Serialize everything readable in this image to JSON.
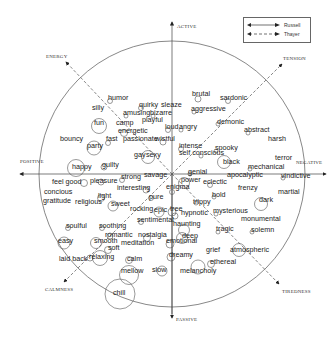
{
  "legend": {
    "items": [
      {
        "label": "Russell",
        "style": "solid"
      },
      {
        "label": "Thayer",
        "style": "dashed"
      }
    ]
  },
  "axes": {
    "active": "ACTIVE",
    "passive": "PASSIVE",
    "positive": "POSITIVE",
    "negative": "NEGATIVE",
    "energy": "ENERGY",
    "tension": "TENSION",
    "calmness": "CALMNESS",
    "tiredness": "TIREDNESS"
  },
  "words": [
    {
      "t": "brutal",
      "x": 194,
      "y": 94
    },
    {
      "t": "sardonic",
      "x": 222,
      "y": 98
    },
    {
      "t": "humor",
      "x": 110,
      "y": 98
    },
    {
      "t": "quirky",
      "x": 141,
      "y": 105
    },
    {
      "t": "sleaze",
      "x": 163,
      "y": 105
    },
    {
      "t": "silly",
      "x": 94,
      "y": 108
    },
    {
      "t": "aggressive",
      "x": 193,
      "y": 109
    },
    {
      "t": "amusing",
      "x": 125,
      "y": 113
    },
    {
      "t": "bizarre",
      "x": 152,
      "y": 113
    },
    {
      "t": "playful",
      "x": 144,
      "y": 120
    },
    {
      "t": "fun",
      "x": 96,
      "y": 123
    },
    {
      "t": "camp",
      "x": 118,
      "y": 123
    },
    {
      "t": "demonic",
      "x": 219,
      "y": 122
    },
    {
      "t": "loud",
      "x": 167,
      "y": 127
    },
    {
      "t": "angry",
      "x": 181,
      "y": 127
    },
    {
      "t": "energetic",
      "x": 120,
      "y": 131
    },
    {
      "t": "abstract",
      "x": 246,
      "y": 130
    },
    {
      "t": "bouncy",
      "x": 62,
      "y": 139
    },
    {
      "t": "fast",
      "x": 108,
      "y": 139
    },
    {
      "t": "passionate",
      "x": 125,
      "y": 139
    },
    {
      "t": "wistful",
      "x": 157,
      "y": 139
    },
    {
      "t": "harsh",
      "x": 270,
      "y": 139
    },
    {
      "t": "party",
      "x": 89,
      "y": 146
    },
    {
      "t": "intense",
      "x": 181,
      "y": 146
    },
    {
      "t": "spooky",
      "x": 217,
      "y": 148
    },
    {
      "t": "self conscious",
      "x": 181,
      "y": 153
    },
    {
      "t": "gay",
      "x": 136,
      "y": 155
    },
    {
      "t": "sexy",
      "x": 148,
      "y": 155
    },
    {
      "t": "terror",
      "x": 277,
      "y": 158
    },
    {
      "t": "black",
      "x": 225,
      "y": 162
    },
    {
      "t": "mechanical",
      "x": 250,
      "y": 167
    },
    {
      "t": "happy",
      "x": 74,
      "y": 167
    },
    {
      "t": "guilty",
      "x": 104,
      "y": 165
    },
    {
      "t": "strong",
      "x": 123,
      "y": 177
    },
    {
      "t": "savage",
      "x": 146,
      "y": 175
    },
    {
      "t": "genial",
      "x": 190,
      "y": 172
    },
    {
      "t": "apocalyptic",
      "x": 229,
      "y": 175
    },
    {
      "t": "vindictive",
      "x": 283,
      "y": 176
    },
    {
      "t": "feel good",
      "x": 54,
      "y": 182
    },
    {
      "t": "pleasure",
      "x": 92,
      "y": 181
    },
    {
      "t": "power",
      "x": 183,
      "y": 180
    },
    {
      "t": "eclectic",
      "x": 205,
      "y": 182
    },
    {
      "t": "interesting",
      "x": 119,
      "y": 188
    },
    {
      "t": "enigma",
      "x": 168,
      "y": 187
    },
    {
      "t": "frenzy",
      "x": 240,
      "y": 188
    },
    {
      "t": "concious",
      "x": 46,
      "y": 192
    },
    {
      "t": "martial",
      "x": 280,
      "y": 192
    },
    {
      "t": "light",
      "x": 100,
      "y": 196
    },
    {
      "t": "pure",
      "x": 151,
      "y": 197
    },
    {
      "t": "bold",
      "x": 214,
      "y": 195
    },
    {
      "t": "trippy",
      "x": 195,
      "y": 202
    },
    {
      "t": "dark",
      "x": 261,
      "y": 200
    },
    {
      "t": "gratitude",
      "x": 45,
      "y": 201
    },
    {
      "t": "religious",
      "x": 77,
      "y": 202
    },
    {
      "t": "sweet",
      "x": 113,
      "y": 204
    },
    {
      "t": "rocking",
      "x": 132,
      "y": 209
    },
    {
      "t": "epic",
      "x": 156,
      "y": 210
    },
    {
      "t": "tree",
      "x": 172,
      "y": 209
    },
    {
      "t": "hypnotic",
      "x": 183,
      "y": 213
    },
    {
      "t": "mysterious",
      "x": 215,
      "y": 211
    },
    {
      "t": "monumental",
      "x": 243,
      "y": 219
    },
    {
      "t": "sentimental",
      "x": 139,
      "y": 220
    },
    {
      "t": "haunting",
      "x": 175,
      "y": 224
    },
    {
      "t": "soulful",
      "x": 68,
      "y": 226
    },
    {
      "t": "soothing",
      "x": 101,
      "y": 226
    },
    {
      "t": "tragic",
      "x": 218,
      "y": 229
    },
    {
      "t": "solemn",
      "x": 253,
      "y": 230
    },
    {
      "t": "romantic",
      "x": 107,
      "y": 235
    },
    {
      "t": "nostalgia",
      "x": 140,
      "y": 235
    },
    {
      "t": "deep",
      "x": 184,
      "y": 236
    },
    {
      "t": "easy",
      "x": 60,
      "y": 241
    },
    {
      "t": "smooth",
      "x": 96,
      "y": 241
    },
    {
      "t": "meditation",
      "x": 123,
      "y": 243
    },
    {
      "t": "emotional",
      "x": 168,
      "y": 241
    },
    {
      "t": "soft",
      "x": 110,
      "y": 248
    },
    {
      "t": "grief",
      "x": 208,
      "y": 250
    },
    {
      "t": "atmospheric",
      "x": 232,
      "y": 250
    },
    {
      "t": "dreamy",
      "x": 171,
      "y": 255
    },
    {
      "t": "laid back",
      "x": 61,
      "y": 259
    },
    {
      "t": "relaxing",
      "x": 91,
      "y": 257
    },
    {
      "t": "calm",
      "x": 129,
      "y": 259
    },
    {
      "t": "ethereal",
      "x": 212,
      "y": 262
    },
    {
      "t": "mellow",
      "x": 123,
      "y": 271
    },
    {
      "t": "slow",
      "x": 154,
      "y": 270
    },
    {
      "t": "melancholy",
      "x": 182,
      "y": 271
    },
    {
      "t": "chill",
      "x": 115,
      "y": 293
    }
  ],
  "circles": [
    {
      "cx": 198,
      "cy": 99,
      "r": 3
    },
    {
      "cx": 228,
      "cy": 101,
      "r": 2.5
    },
    {
      "cx": 110,
      "cy": 101,
      "r": 2.5
    },
    {
      "cx": 141,
      "cy": 108,
      "r": 2.5
    },
    {
      "cx": 194,
      "cy": 112,
      "r": 2
    },
    {
      "cx": 126,
      "cy": 116,
      "r": 2
    },
    {
      "cx": 153,
      "cy": 116,
      "r": 2
    },
    {
      "cx": 99,
      "cy": 126,
      "r": 7.5
    },
    {
      "cx": 168,
      "cy": 130,
      "r": 2.5
    },
    {
      "cx": 181,
      "cy": 130,
      "r": 2
    },
    {
      "cx": 124,
      "cy": 133,
      "r": 3.5
    },
    {
      "cx": 218,
      "cy": 124,
      "r": 2
    },
    {
      "cx": 248,
      "cy": 133,
      "r": 2
    },
    {
      "cx": 108,
      "cy": 143,
      "r": 2.5
    },
    {
      "cx": 163,
      "cy": 142,
      "r": 3
    },
    {
      "cx": 94,
      "cy": 148,
      "r": 7
    },
    {
      "cx": 181,
      "cy": 149,
      "r": 2.5
    },
    {
      "cx": 216,
      "cy": 151,
      "r": 2
    },
    {
      "cx": 201,
      "cy": 156,
      "r": 2
    },
    {
      "cx": 148,
      "cy": 157,
      "r": 6.5
    },
    {
      "cx": 224,
      "cy": 162,
      "r": 6.5
    },
    {
      "cx": 250,
      "cy": 169,
      "r": 2
    },
    {
      "cx": 76,
      "cy": 168,
      "r": 8.5
    },
    {
      "cx": 104,
      "cy": 167,
      "r": 3
    },
    {
      "cx": 122,
      "cy": 180,
      "r": 2.5
    },
    {
      "cx": 190,
      "cy": 174,
      "r": 2
    },
    {
      "cx": 283,
      "cy": 178,
      "r": 2
    },
    {
      "cx": 84,
      "cy": 183,
      "r": 3.5
    },
    {
      "cx": 101,
      "cy": 182,
      "r": 3
    },
    {
      "cx": 184,
      "cy": 183,
      "r": 5.5
    },
    {
      "cx": 210,
      "cy": 185,
      "r": 2.5
    },
    {
      "cx": 146,
      "cy": 190,
      "r": 3
    },
    {
      "cx": 172,
      "cy": 192,
      "r": 2.5
    },
    {
      "cx": 101,
      "cy": 198,
      "r": 3.5
    },
    {
      "cx": 151,
      "cy": 198,
      "r": 2.5
    },
    {
      "cx": 214,
      "cy": 197,
      "r": 2
    },
    {
      "cx": 196,
      "cy": 203,
      "r": 2
    },
    {
      "cx": 261,
      "cy": 204,
      "r": 6.5
    },
    {
      "cx": 113,
      "cy": 206,
      "r": 5
    },
    {
      "cx": 159,
      "cy": 212,
      "r": 5
    },
    {
      "cx": 172,
      "cy": 212,
      "r": 4
    },
    {
      "cx": 216,
      "cy": 214,
      "r": 2
    },
    {
      "cx": 175,
      "cy": 216,
      "r": 3
    },
    {
      "cx": 141,
      "cy": 222,
      "r": 2.5
    },
    {
      "cx": 68,
      "cy": 228,
      "r": 2.5
    },
    {
      "cx": 102,
      "cy": 228,
      "r": 2.5
    },
    {
      "cx": 184,
      "cy": 230,
      "r": 5.5
    },
    {
      "cx": 218,
      "cy": 232,
      "r": 2
    },
    {
      "cx": 252,
      "cy": 232,
      "r": 2
    },
    {
      "cx": 110,
      "cy": 236,
      "r": 3
    },
    {
      "cx": 147,
      "cy": 238,
      "r": 3.5
    },
    {
      "cx": 182,
      "cy": 238,
      "r": 5.5
    },
    {
      "cx": 64,
      "cy": 243,
      "r": 6
    },
    {
      "cx": 96,
      "cy": 243,
      "r": 5.5
    },
    {
      "cx": 170,
      "cy": 244,
      "r": 4
    },
    {
      "cx": 108,
      "cy": 250,
      "r": 3.5
    },
    {
      "cx": 239,
      "cy": 250,
      "r": 6.5
    },
    {
      "cx": 171,
      "cy": 257,
      "r": 4
    },
    {
      "cx": 90,
      "cy": 258,
      "r": 3
    },
    {
      "cx": 100,
      "cy": 258,
      "r": 7.5
    },
    {
      "cx": 129,
      "cy": 260,
      "r": 3.5
    },
    {
      "cx": 211,
      "cy": 264,
      "r": 3.5
    },
    {
      "cx": 129,
      "cy": 275,
      "r": 9.5
    },
    {
      "cx": 162,
      "cy": 271,
      "r": 5
    },
    {
      "cx": 198,
      "cy": 267,
      "r": 7
    },
    {
      "cx": 120,
      "cy": 294,
      "r": 15
    }
  ]
}
